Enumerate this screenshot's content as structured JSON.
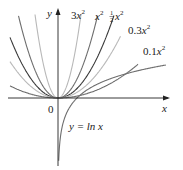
{
  "chart_data": {
    "type": "line",
    "title": "",
    "xlabel": "x",
    "ylabel": "y",
    "origin_label": "0",
    "grid": false,
    "legend": "inline labels",
    "xlim": [
      -2.9,
      6.4
    ],
    "ylim": [
      -3.8,
      5.1
    ],
    "series": [
      {
        "name": "3x^2",
        "label": "3x²",
        "coef": 3,
        "color": "#b8b8b8"
      },
      {
        "name": "x^2",
        "label": "x²",
        "coef": 1,
        "color": "#6e6e6e"
      },
      {
        "name": "1/2 x^2",
        "label": "½x²",
        "coef": 0.5,
        "color": "#3a3a3a"
      },
      {
        "name": "0.3x^2",
        "label": "0.3x²",
        "coef": 0.3,
        "color": "#b8b8b8"
      },
      {
        "name": "0.1x^2",
        "label": "0.1x²",
        "coef": 0.1,
        "color": "#6e6e6e"
      },
      {
        "name": "ln x",
        "label": "y = ln x",
        "func": "ln",
        "color": "#6e6e6e"
      }
    ]
  },
  "labels": {
    "y_axis": "y",
    "x_axis": "x",
    "origin": "0",
    "c3_coef": "3",
    "c3_var": "x",
    "c1_var": "x",
    "c05_num": "1",
    "c05_den": "2",
    "c05_var": "x",
    "c03_coef": "0.3",
    "c03_var": "x",
    "c01_coef": "0.1",
    "c01_var": "x",
    "exp": "2",
    "ln_label": "y = ln x"
  }
}
